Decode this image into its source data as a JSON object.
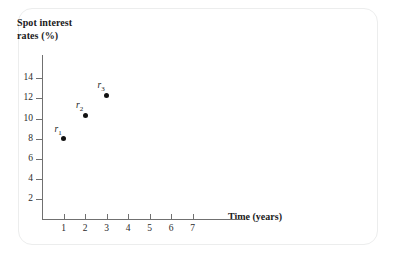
{
  "figure": {
    "background_color": "#ffffff",
    "border_color": "#eceded",
    "axis_color": "#707070",
    "point_color": "#111111"
  },
  "chart_data": {
    "type": "scatter",
    "title": "",
    "xlabel": "Time (years)",
    "ylabel": "Spot interest\nrates (%)",
    "ylabel_line1": "Spot interest",
    "ylabel_line2": "rates (%)",
    "x": [
      1,
      2,
      3
    ],
    "values": [
      8.0,
      10.3,
      12.3
    ],
    "point_labels": [
      "r",
      "r",
      "r"
    ],
    "point_label_subs": [
      "1",
      "2",
      "3"
    ],
    "xlim": [
      0,
      7.6
    ],
    "ylim": [
      0,
      15
    ],
    "xticks": [
      1,
      2,
      3,
      4,
      5,
      6,
      7
    ],
    "xtick_labels": [
      "1",
      "2",
      "3",
      "4",
      "5",
      "6",
      "7"
    ],
    "yticks": [
      2,
      4,
      6,
      8,
      10,
      12,
      14
    ],
    "ytick_labels": [
      "2",
      "4",
      "6",
      "8",
      "10",
      "12",
      "14"
    ],
    "grid": false,
    "legend": "none",
    "series": [
      {
        "name": "Spot interest rates",
        "points": [
          {
            "label": "r",
            "sub": "1",
            "x": 1,
            "y": 8.0
          },
          {
            "label": "r",
            "sub": "2",
            "x": 2,
            "y": 10.3
          },
          {
            "label": "r",
            "sub": "3",
            "x": 3,
            "y": 12.3
          }
        ]
      }
    ]
  }
}
